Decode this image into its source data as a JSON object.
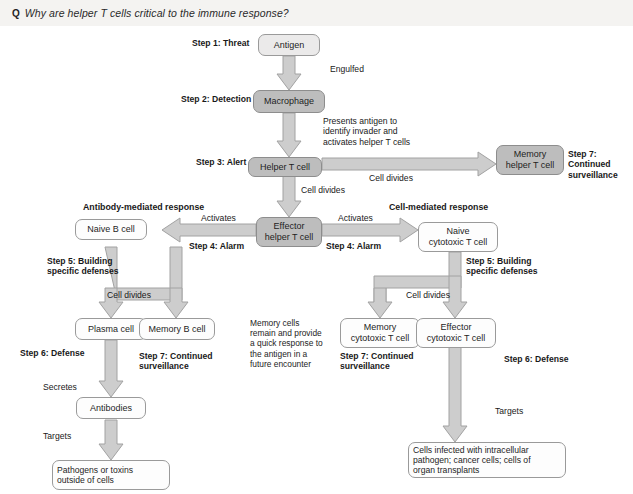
{
  "question": {
    "marker": "Q",
    "text": "Why are helper T cells critical to the immune response?"
  },
  "colors": {
    "bar_background": "#f4f3f1",
    "node_light": "#fdfdfd",
    "node_grey": "#bdbdbd",
    "arrow_fill": "#cccccc",
    "arrow_stroke": "#9a9a9a",
    "text": "#1a1a1a"
  },
  "diagram": {
    "nodes": [
      {
        "id": "antigen",
        "label": "Antigen",
        "fill": "pale"
      },
      {
        "id": "macrophage",
        "label": "Macrophage",
        "fill": "grey"
      },
      {
        "id": "helper-t-cell",
        "label": "Helper T cell",
        "fill": "grey"
      },
      {
        "id": "memory-helper-t",
        "label": "Memory\nhelper T cell",
        "fill": "grey"
      },
      {
        "id": "effector-helper-t",
        "label": "Effector\nhelper T cell",
        "fill": "grey"
      },
      {
        "id": "naive-b-cell",
        "label": "Naive B cell",
        "fill": "light"
      },
      {
        "id": "naive-cytotoxic-t",
        "label": "Naive\ncytotoxic T cell",
        "fill": "light"
      },
      {
        "id": "plasma-cell",
        "label": "Plasma cell",
        "fill": "light"
      },
      {
        "id": "memory-b-cell",
        "label": "Memory B cell",
        "fill": "light"
      },
      {
        "id": "memory-cytotoxic-t",
        "label": "Memory\ncytotoxic T cell",
        "fill": "light"
      },
      {
        "id": "effector-cytotoxic-t",
        "label": "Effector\ncytotoxic T cell",
        "fill": "light"
      },
      {
        "id": "antibodies",
        "label": "Antibodies",
        "fill": "light"
      },
      {
        "id": "pathogens",
        "label": "Pathogens or toxins\noutside of cells",
        "fill": "light"
      },
      {
        "id": "infected-cells",
        "label": "Cells infected with intracellular\npathogen; cancer cells; cells of\norgan transplants",
        "fill": "light"
      }
    ],
    "step_labels": {
      "step1": "Step 1: Threat",
      "step2": "Step 2: Detection",
      "step3": "Step 3: Alert",
      "step4_left": "Step 4: Alarm",
      "step4_right": "Step 4: Alarm",
      "step5_left": "Step 5: Building\nspecific defenses",
      "step5_right": "Step 5: Building\nspecific defenses",
      "step6_left": "Step 6: Defense",
      "step6_right": "Step 6: Defense",
      "step7_helper": "Step 7: Continued\nsurveillance",
      "step7_memory_b": "Step 7: Continued\nsurveillance",
      "step7_memory_cytotoxic": "Step 7: Continued\nsurveillance"
    },
    "branch_headers": {
      "left": "Antibody-mediated response",
      "right": "Cell-mediated response"
    },
    "edge_labels": {
      "engulfed": "Engulfed",
      "presents": "Presents antigen to\nidentify invader and\nactivates helper T cells",
      "cell_divides_memory_helper": "Cell divides",
      "cell_divides_effector": "Cell divides",
      "activates_left": "Activates",
      "activates_right": "Activates",
      "cell_divides_b": "Cell divides",
      "cell_divides_t": "Cell divides",
      "secretes": "Secretes",
      "targets_left": "Targets",
      "targets_right": "Targets"
    },
    "annotation": "Memory cells\nremain and provide\na quick response to\nthe antigen in a\nfuture encounter"
  }
}
